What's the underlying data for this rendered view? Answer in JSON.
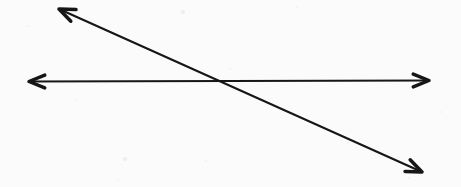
{
  "document": {
    "title": "Intersecting Lines Diagram",
    "kind": "scanned-geometry-figure",
    "width": 461,
    "height": 187
  },
  "canvas": {
    "background_color": "#fcfcfc",
    "paper_tint": "#fbfbfb",
    "width": 461,
    "height": 187
  },
  "style": {
    "stroke_color": "#161616",
    "stroke_width": 2.1,
    "arrowhead_style": "open-chevron",
    "arrowhead_length": 17,
    "arrowhead_half_angle_deg": 22
  },
  "figure": {
    "line_count": 2,
    "arrowhead_count": 4,
    "intersection": {
      "label": "intersection-point",
      "x": 219,
      "y": 81
    },
    "lines": [
      {
        "name": "horizontal-line",
        "orientation": "horizontal",
        "double_headed": true,
        "x1": 29,
        "y1": 81.5,
        "x2": 429,
        "y2": 80.5,
        "slope": -0.0025,
        "angle_deg": -0.14
      },
      {
        "name": "diagonal-line",
        "orientation": "descending-diagonal",
        "double_headed": true,
        "x1": 59,
        "y1": 9,
        "x2": 422,
        "y2": 172,
        "slope": 0.449,
        "angle_deg": 24.2
      }
    ],
    "arrowheads": [
      {
        "name": "horizontal-left-arrowhead",
        "x": 29,
        "y": 81.5,
        "direction_deg": 180
      },
      {
        "name": "horizontal-right-arrowhead",
        "x": 429,
        "y": 80.5,
        "direction_deg": 0
      },
      {
        "name": "diagonal-top-left-arrowhead",
        "x": 59,
        "y": 9,
        "direction_deg": 204
      },
      {
        "name": "diagonal-bottom-right-arrowhead",
        "x": 422,
        "y": 172,
        "direction_deg": 24
      }
    ],
    "specks": [
      {
        "x": 183,
        "y": 12,
        "r": 1.6,
        "color": "#efefef"
      },
      {
        "x": 297,
        "y": 7,
        "r": 1.2,
        "color": "#f2f2f2"
      },
      {
        "x": 28,
        "y": 26,
        "r": 1.1,
        "color": "#f1f1f1"
      },
      {
        "x": 230,
        "y": 69,
        "r": 1.3,
        "color": "#f0f0f0"
      },
      {
        "x": 125,
        "y": 159,
        "r": 1.7,
        "color": "#ededed"
      },
      {
        "x": 441,
        "y": 112,
        "r": 1.2,
        "color": "#f2f2f2"
      },
      {
        "x": 75,
        "y": 100,
        "r": 1.0,
        "color": "#f3f3f3"
      },
      {
        "x": 348,
        "y": 143,
        "r": 1.1,
        "color": "#f1f1f1"
      },
      {
        "x": 206,
        "y": 161,
        "r": 1.2,
        "color": "#f0f0f0"
      },
      {
        "x": 409,
        "y": 178,
        "r": 1.0,
        "color": "#f2f2f2"
      },
      {
        "x": 118,
        "y": 180,
        "r": 1.0,
        "color": "#f3f3f3"
      },
      {
        "x": 258,
        "y": 120,
        "r": 0.9,
        "color": "#f3f3f3"
      }
    ]
  }
}
